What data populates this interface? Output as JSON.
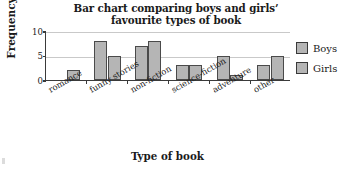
{
  "chart_data": {
    "type": "bar",
    "title": "Bar chart comparing boys and girls’ favourite types of book",
    "title_line1": "Bar chart comparing boys and girls’",
    "title_line2": "favourite types of book",
    "xlabel": "Type of book",
    "ylabel": "Frequency",
    "categories": [
      "romance",
      "funny stories",
      "non-fiction",
      "science-fiction",
      "adventure",
      "other"
    ],
    "series": [
      {
        "name": "Boys",
        "values": [
          0,
          8,
          7,
          3,
          5,
          3
        ],
        "color": "#b5b5b5"
      },
      {
        "name": "Girls",
        "values": [
          2,
          5,
          8,
          3,
          1,
          5
        ],
        "color": "#b5b5b5"
      }
    ],
    "ylim": [
      0,
      10
    ],
    "yticks": [
      0,
      5,
      10
    ],
    "ytick_labels": [
      "0",
      "5",
      "10"
    ],
    "grid": "horizontal",
    "legend_position": "right",
    "bar_border_color": "#4a4a4a",
    "grid_color": "#c9c9c9",
    "axis_color": "#3a3a3a"
  },
  "legend": {
    "items": [
      {
        "label": "Boys"
      },
      {
        "label": "Girls"
      }
    ]
  }
}
